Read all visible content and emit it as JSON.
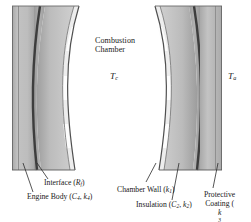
{
  "figure": {
    "title_area": {
      "chamber_label_line1": "Combustion",
      "chamber_label_line2": "Chamber"
    },
    "temperatures": [
      {
        "name": "combustion-gas-temperature",
        "symbol": "T",
        "subscript": "c"
      },
      {
        "name": "ambient-temperature",
        "symbol": "T",
        "subscript": "a"
      }
    ],
    "callouts": [
      {
        "name": "interface",
        "text_prefix": "Interface (",
        "symbol": "R",
        "subscript": "f",
        "text_suffix": ")"
      },
      {
        "name": "engine-body",
        "text_prefix": "Engine Body (",
        "symbol": "C",
        "subscript": "4",
        "mid": ", ",
        "symbol2": "k",
        "subscript2": "4",
        "text_suffix": ")"
      },
      {
        "name": "chamber-wall",
        "text_prefix": "Chamber Wall (",
        "symbol": "k",
        "subscript": "1",
        "text_suffix": ")"
      },
      {
        "name": "insulation",
        "text_prefix": "Insulation (",
        "symbol": "C",
        "subscript": "2",
        "mid": ", ",
        "symbol2": "k",
        "subscript2": "2",
        "text_suffix": ")"
      },
      {
        "name": "protective-coating",
        "line1": "Protective",
        "text_prefix": "Coating (",
        "symbol": "k",
        "subscript": "3",
        "text_suffix": ")"
      }
    ],
    "layers": [
      {
        "name": "engine-body",
        "color": "#bdbdbd",
        "role": "outermost structural body"
      },
      {
        "name": "interface-line",
        "color": "#4a4a4a",
        "role": "thermal contact resistance line"
      },
      {
        "name": "insulation",
        "color": "#a9a9a9",
        "role": "insulating layer"
      },
      {
        "name": "chamber-wall",
        "color": "#b5b5b5",
        "role": "chamber wall"
      },
      {
        "name": "protective-coating",
        "color": "#f2f2f2",
        "role": "inner protective coating"
      }
    ],
    "colors": {
      "background": "#ffffff",
      "body_gray": "#bcbcbc",
      "wall_gray": "#b2b2b2",
      "dark_line": "#4d4d4d",
      "coating_light": "#f0f0f0",
      "text": "#1a1a1a",
      "leader_line": "#2b2b2b"
    }
  }
}
